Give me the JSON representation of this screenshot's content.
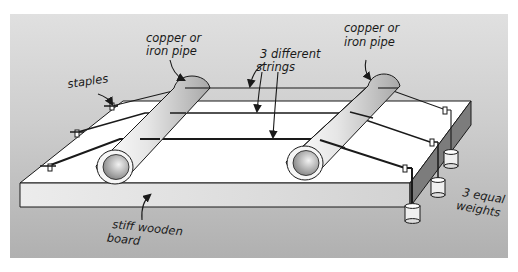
{
  "diagram": {
    "labels": {
      "pipe_left_line1": "copper or",
      "pipe_left_line2": "iron pipe",
      "pipe_right_line1": "copper or",
      "pipe_right_line2": "iron pipe",
      "staples": "staples",
      "strings_line1": "3 different",
      "strings_line2": "strings",
      "board_line1": "stiff wooden",
      "board_line2": "board",
      "weights_line1": "3 equal",
      "weights_line2": "weights"
    },
    "components": [
      "stiff wooden board",
      "2 copper or iron pipes",
      "3 different strings",
      "staples",
      "3 equal weights"
    ],
    "colors": {
      "background": "#b9b9b9",
      "background_top": "#dcdcdc",
      "board_top": "#ffffff",
      "board_front": "#e2e2e2",
      "board_side": "#7a7a7a",
      "outline": "#1a1a1a",
      "pipe_light": "#f4f4f4",
      "pipe_dark": "#9a9a9a"
    }
  }
}
